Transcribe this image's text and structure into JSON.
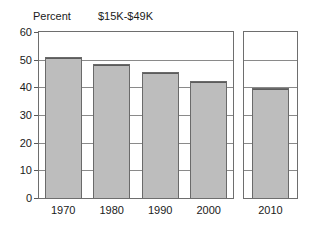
{
  "chart_data": {
    "type": "bar",
    "title": "$15K-$49K",
    "xlabel": "",
    "ylabel": "Percent",
    "categories": [
      "1970",
      "1980",
      "1990",
      "2000",
      "2010"
    ],
    "values": [
      50.8,
      48.3,
      45.5,
      42.3,
      39.8
    ],
    "ylim": [
      0,
      60
    ],
    "yticks": [
      "0",
      "10",
      "20",
      "30",
      "40",
      "50",
      "60"
    ],
    "ytick_values": [
      0,
      10,
      20,
      30,
      40,
      50,
      60
    ],
    "grid": true,
    "legend": "none",
    "panels": [
      {
        "name": "historical",
        "categories": [
          "1970",
          "1980",
          "1990",
          "2000"
        ]
      },
      {
        "name": "projected",
        "categories": [
          "2010"
        ]
      }
    ],
    "bar_fill_color": "#bdbdbd",
    "bar_border_color": "#6a6a6a",
    "axis_color": "#6e6e6e",
    "grid_color": "#8a8a8a"
  }
}
